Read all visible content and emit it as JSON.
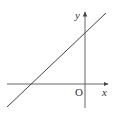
{
  "diagram": {
    "type": "coordinate-plane-line",
    "axes": {
      "x_label": "x",
      "y_label": "y",
      "origin_label": "O",
      "color": "#444444"
    },
    "line": {
      "description": "straight line with positive slope, positive y-intercept, negative x-intercept",
      "color": "#444444"
    }
  }
}
